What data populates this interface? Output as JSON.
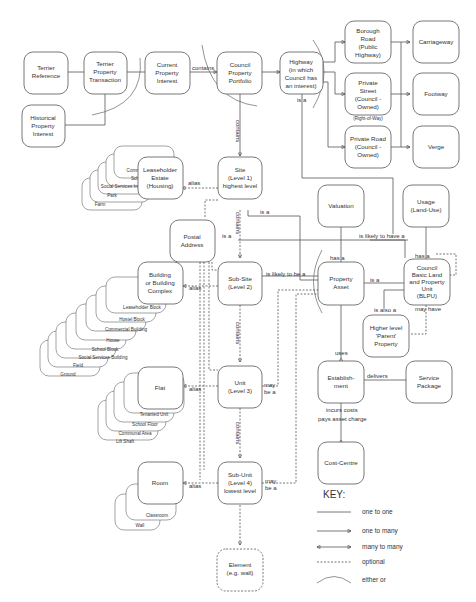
{
  "entities": {
    "terrier_reference": [
      "Terrier",
      "Reference"
    ],
    "terrier_property_transaction": [
      "Terrier",
      "Property",
      "Transaction"
    ],
    "historical_property_interest": [
      "Historical",
      "Property",
      "Interest"
    ],
    "current_property_interest": [
      "Current",
      "Property",
      "Interest"
    ],
    "council_property_portfolio": [
      "Council",
      "Property",
      "Portfolio"
    ],
    "highway": [
      "Highway",
      "(in which",
      "Council has",
      "an interest)"
    ],
    "borough_road": [
      "Borough",
      "Road",
      "(Public",
      "Highway)"
    ],
    "private_street": [
      "Private",
      "Street",
      "(Council -",
      "Owned)"
    ],
    "private_road": [
      "Private Road",
      "(Council -",
      "Owned)"
    ],
    "carriageway": [
      "Carriageway"
    ],
    "footway": [
      "Footway"
    ],
    "verge": [
      "Verge"
    ],
    "leaseholder_estate": [
      "Leaseholder",
      "Estate",
      "(Housing)"
    ],
    "site": [
      "Site",
      "(Level 1)",
      "highest level"
    ],
    "postal_address": [
      "Postal",
      "Address"
    ],
    "valuation": [
      "Valuation"
    ],
    "usage": [
      "Usage",
      "(Land-Use)"
    ],
    "building": [
      "Building",
      "or Building",
      "Complex"
    ],
    "sub_site": [
      "Sub-Site",
      "(Level 2)"
    ],
    "property_asset": [
      "Property",
      "Asset"
    ],
    "blpu": [
      "Council",
      "Basic Land",
      "and Property",
      "Unit",
      "(BLPU)"
    ],
    "higher_level_parent": [
      "Higher level",
      "'Parent'",
      "Property"
    ],
    "flat": [
      "Flat"
    ],
    "unit": [
      "Unit",
      "(Level 3)"
    ],
    "establishment": [
      "Establish-",
      "ment"
    ],
    "service_package": [
      "Service",
      "Package"
    ],
    "cost_centre": [
      "Cost-Centre"
    ],
    "room": [
      "Room"
    ],
    "sub_unit": [
      "Sub-Unit",
      "(Level 4)",
      "lowest level"
    ],
    "element": [
      "Element",
      "(e.g. wall)"
    ]
  },
  "stacks": {
    "leaseholder": [
      "Commercial Estate",
      "School",
      "Social Services Institution",
      "Park",
      "Farm"
    ],
    "building": [
      "Leaseholder Block",
      "Hostel Block",
      "Commercial Building",
      "House",
      "School Block",
      "Social Services Building",
      "Field",
      "Ground"
    ],
    "flat": [
      "Tenanted Unit",
      "School Floor",
      "Communal Area",
      "Lift Shaft"
    ],
    "room": [
      "Classroom",
      "Wall"
    ]
  },
  "labels": {
    "contains": "contains",
    "is_a": "is a",
    "alias": "alias",
    "right_of_way": "(Right-of-Way)",
    "is_likely_to_have_a": "is likely to have a",
    "is_likely_to_be_a": "is likely to be a",
    "has_a": "has a",
    "is_also_a": "is also a",
    "may_have": "may have",
    "uses": "uses",
    "delivers": "delivers",
    "incurs_costs": "incurs costs",
    "pays_asset_charge": "pays asset charge",
    "may": "may",
    "be_a": "be a"
  },
  "key": {
    "title": "KEY:",
    "items": [
      "one to one",
      "one to many",
      "many to many",
      "optional",
      "either or"
    ]
  }
}
